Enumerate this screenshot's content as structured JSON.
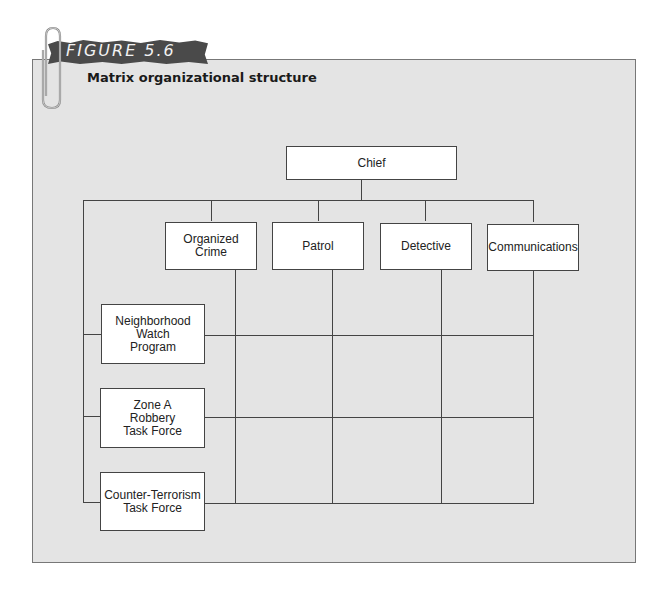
{
  "figure": {
    "label": "FIGURE 5.6",
    "title": "Matrix organizational structure"
  },
  "chart": {
    "top": {
      "label": "Chief"
    },
    "departments": [
      {
        "label": "Organized Crime"
      },
      {
        "label": "Patrol"
      },
      {
        "label": "Detective"
      },
      {
        "label": "Communications"
      }
    ],
    "projects": [
      {
        "label": "Neighborhood Watch Program"
      },
      {
        "label": "Zone A Robbery Task Force"
      },
      {
        "label": "Counter-Terrorism Task Force"
      }
    ]
  },
  "colors": {
    "panel_bg": "#e4e4e4",
    "banner_bg": "#4a4a4a",
    "box_bg": "#ffffff",
    "line": "#444444"
  }
}
